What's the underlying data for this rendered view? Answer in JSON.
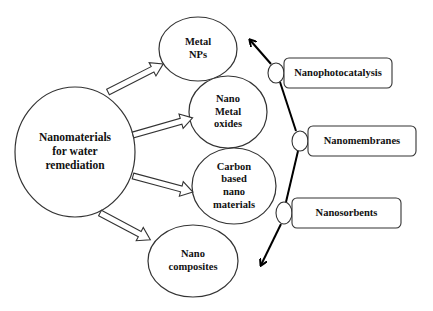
{
  "diagram": {
    "central": {
      "lines": [
        "Nanomaterials",
        "for water",
        "remediation"
      ]
    },
    "categories": [
      {
        "id": "metal-nps",
        "lines": [
          "Metal",
          "NPs"
        ]
      },
      {
        "id": "nano-metal-oxides",
        "lines": [
          "Nano",
          "Metal",
          "oxides"
        ]
      },
      {
        "id": "carbon-based",
        "lines": [
          "Carbon",
          "based",
          "nano",
          "materials"
        ]
      },
      {
        "id": "nano-composites",
        "lines": [
          "Nano",
          "composites"
        ]
      }
    ],
    "applications": [
      {
        "id": "nanophotocatalysis",
        "label": "Nanophotocatalysis"
      },
      {
        "id": "nanomembranes",
        "label": "Nanomembranes"
      },
      {
        "id": "nanosorbents",
        "label": "Nanosorbents"
      }
    ],
    "colors": {
      "stroke": "#333333",
      "axis": "#000000",
      "background": "#ffffff",
      "text": "#111111"
    }
  }
}
